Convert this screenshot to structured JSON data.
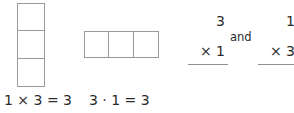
{
  "figure": {
    "ink_color": "#2b2b2b",
    "grid_line_color": "#9a9a9a",
    "background_color": "#ffffff"
  },
  "models": {
    "column": {
      "name": "column-model",
      "orientation": "vertical",
      "rows": 3,
      "columns": 1,
      "cell_count": 3,
      "cells": [
        "",
        "",
        ""
      ]
    },
    "row": {
      "name": "row-model",
      "orientation": "horizontal",
      "rows": 1,
      "columns": 3,
      "cell_count": 3,
      "cells": [
        "",
        "",
        ""
      ]
    }
  },
  "vertical_problems": {
    "conjunction": "and",
    "left": {
      "factor": "3",
      "operation": "× 1",
      "operator": "×",
      "multiplier": "1"
    },
    "right": {
      "factor": "1",
      "operation": "× 3",
      "operator": "×",
      "multiplier": "3"
    }
  },
  "equations": {
    "column": "1 × 3 = 3",
    "row": "3 · 1 = 3"
  }
}
